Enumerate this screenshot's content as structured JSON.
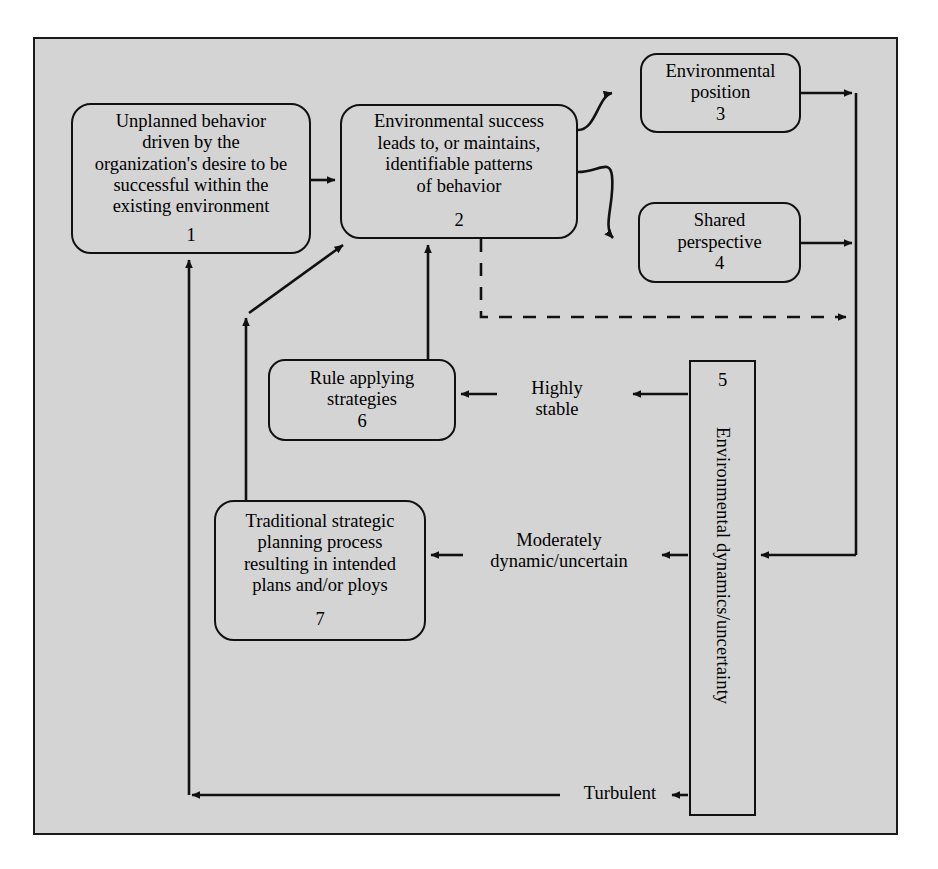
{
  "diagram": {
    "background_color": "#d4d4d4",
    "line_color": "#111111",
    "nodes": [
      {
        "id": "node1",
        "number": "1",
        "label": "Unplanned behavior\ndriven by the\norganization's desire to be\nsuccessful within the\nexisting environment"
      },
      {
        "id": "node2",
        "number": "2",
        "label": "Environmental success\nleads to, or maintains,\nidentifiable patterns\nof behavior"
      },
      {
        "id": "node3",
        "number": "3",
        "label": "Environmental\nposition"
      },
      {
        "id": "node4",
        "number": "4",
        "label": "Shared\nperspective"
      },
      {
        "id": "node5",
        "number": "5",
        "label": "Environmental dynamics/uncertainty"
      },
      {
        "id": "node6",
        "number": "6",
        "label": "Rule applying\nstrategies"
      },
      {
        "id": "node7",
        "number": "7",
        "label": "Traditional strategic\nplanning process\nresulting in intended\nplans and/or ploys"
      }
    ],
    "edge_labels": {
      "highly_stable": "Highly\nstable",
      "moderately_dynamic": "Moderately\ndynamic/uncertain",
      "turbulent": "Turbulent"
    }
  }
}
